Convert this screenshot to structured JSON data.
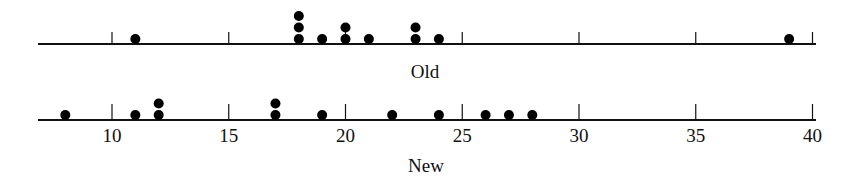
{
  "chart_data": {
    "type": "dot",
    "title": "",
    "x_ticks": [
      10,
      15,
      20,
      25,
      30,
      35,
      40
    ],
    "x_range": [
      7,
      40
    ],
    "grid": false,
    "series": [
      {
        "name": "Old",
        "values": [
          11,
          18,
          18,
          18,
          19,
          20,
          20,
          21,
          23,
          23,
          24,
          39
        ]
      },
      {
        "name": "New",
        "values": [
          8,
          11,
          12,
          12,
          17,
          17,
          19,
          22,
          24,
          26,
          27,
          28
        ]
      }
    ]
  },
  "labels": {
    "old_axis_label": "Old",
    "new_axis_label": "New",
    "ticks": [
      "10",
      "15",
      "20",
      "25",
      "30",
      "35",
      "40"
    ]
  }
}
